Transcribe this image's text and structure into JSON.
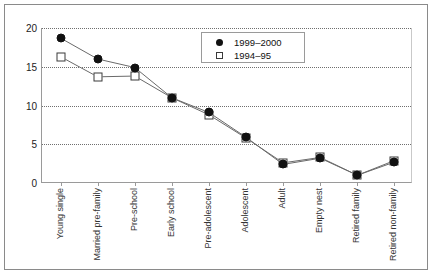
{
  "chart_data": {
    "type": "line",
    "title": "",
    "xlabel": "",
    "ylabel": "",
    "ylim": [
      0,
      20
    ],
    "yticks": [
      0,
      5,
      10,
      15,
      20
    ],
    "grid": true,
    "legend_position": "top-right",
    "categories": [
      "Young single",
      "Married pre-family",
      "Pre-school",
      "Early school",
      "Pre-adolescent",
      "Adolescent",
      "Adult",
      "Empty nest",
      "Retired family",
      "Retired non-family"
    ],
    "series": [
      {
        "name": "1999–2000",
        "marker": "filled-circle",
        "values": [
          18.7,
          16.0,
          14.9,
          11.0,
          9.1,
          5.9,
          2.4,
          3.2,
          1.0,
          2.7
        ]
      },
      {
        "name": "1994–95",
        "marker": "open-square",
        "values": [
          16.3,
          13.7,
          13.8,
          11.0,
          8.8,
          5.8,
          2.6,
          3.3,
          1.0,
          2.9
        ]
      }
    ]
  },
  "legend": {
    "items": [
      {
        "label": "1999–2000",
        "marker": "filled-circle"
      },
      {
        "label": "1994–95",
        "marker": "open-square"
      }
    ]
  }
}
